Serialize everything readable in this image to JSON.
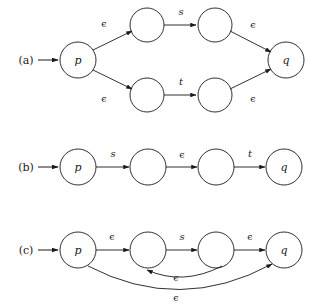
{
  "figure": {
    "title": "",
    "background": "#ffffff",
    "stroke": "#1a1a1a",
    "panels": [
      {
        "id": "a",
        "label": "(a)",
        "label_x": 26,
        "label_y": 64,
        "start_arrow": {
          "x1": 38,
          "y1": 60,
          "x2": 58,
          "y2": 60
        },
        "nodes": [
          {
            "name": "p",
            "label": "p",
            "cx": 78,
            "cy": 60,
            "r": 18
          },
          {
            "name": "a-top-1",
            "label": "",
            "cx": 147,
            "cy": 25,
            "r": 17
          },
          {
            "name": "a-top-2",
            "label": "",
            "cx": 215,
            "cy": 25,
            "r": 17
          },
          {
            "name": "a-bot-1",
            "label": "",
            "cx": 147,
            "cy": 95,
            "r": 17
          },
          {
            "name": "a-bot-2",
            "label": "",
            "cx": 215,
            "cy": 95,
            "r": 17
          },
          {
            "name": "q",
            "label": "q",
            "cx": 286,
            "cy": 60,
            "r": 18
          }
        ],
        "edges": [
          {
            "from": "p",
            "to": "a-top-1",
            "label": "ϵ",
            "lx": 104,
            "ly": 27
          },
          {
            "from": "a-top-1",
            "to": "a-top-2",
            "label": "s",
            "lx": 181,
            "ly": 14
          },
          {
            "from": "a-top-2",
            "to": "q",
            "label": "ϵ",
            "lx": 253,
            "ly": 27
          },
          {
            "from": "p",
            "to": "a-bot-1",
            "label": "ϵ",
            "lx": 104,
            "ly": 101
          },
          {
            "from": "a-bot-1",
            "to": "a-bot-2",
            "label": "t",
            "lx": 181,
            "ly": 84
          },
          {
            "from": "a-bot-2",
            "to": "q",
            "label": "ϵ",
            "lx": 253,
            "ly": 101
          }
        ]
      },
      {
        "id": "b",
        "label": "(b)",
        "label_x": 26,
        "label_y": 171,
        "start_arrow": {
          "x1": 38,
          "y1": 167,
          "x2": 58,
          "y2": 167
        },
        "nodes": [
          {
            "name": "p",
            "label": "p",
            "cx": 78,
            "cy": 167,
            "r": 18
          },
          {
            "name": "b-1",
            "label": "",
            "cx": 148,
            "cy": 167,
            "r": 18
          },
          {
            "name": "b-2",
            "label": "",
            "cx": 216,
            "cy": 167,
            "r": 18
          },
          {
            "name": "q",
            "label": "q",
            "cx": 284,
            "cy": 167,
            "r": 18
          }
        ],
        "edges": [
          {
            "from": "p",
            "to": "b-1",
            "label": "s",
            "lx": 113,
            "ly": 156
          },
          {
            "from": "b-1",
            "to": "b-2",
            "label": "ϵ",
            "lx": 182,
            "ly": 157
          },
          {
            "from": "b-2",
            "to": "q",
            "label": "t",
            "lx": 250,
            "ly": 156
          }
        ]
      },
      {
        "id": "c",
        "label": "(c)",
        "label_x": 26,
        "label_y": 254,
        "start_arrow": {
          "x1": 38,
          "y1": 250,
          "x2": 58,
          "y2": 250
        },
        "nodes": [
          {
            "name": "p",
            "label": "p",
            "cx": 78,
            "cy": 250,
            "r": 18
          },
          {
            "name": "c-1",
            "label": "",
            "cx": 148,
            "cy": 250,
            "r": 18
          },
          {
            "name": "c-2",
            "label": "",
            "cx": 216,
            "cy": 250,
            "r": 18
          },
          {
            "name": "q",
            "label": "q",
            "cx": 284,
            "cy": 250,
            "r": 18
          }
        ],
        "edges": [
          {
            "from": "p",
            "to": "c-1",
            "label": "ϵ",
            "lx": 112,
            "ly": 239
          },
          {
            "from": "c-1",
            "to": "c-2",
            "label": "s",
            "lx": 182,
            "ly": 239
          },
          {
            "from": "c-2",
            "to": "q",
            "label": "ϵ",
            "lx": 250,
            "ly": 239
          },
          {
            "from": "c-2",
            "to": "c-1",
            "label": "ϵ",
            "lx": 176,
            "ly": 278,
            "curved": true
          },
          {
            "from": "p",
            "to": "q",
            "label": "ϵ",
            "lx": 176,
            "ly": 298,
            "curved": true
          }
        ]
      }
    ]
  }
}
